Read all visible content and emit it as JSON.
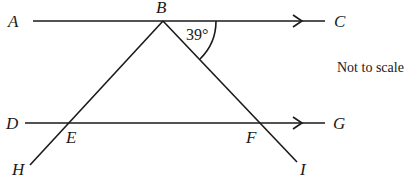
{
  "diagram": {
    "points": {
      "A": "A",
      "B": "B",
      "C": "C",
      "D": "D",
      "E": "E",
      "F": "F",
      "G": "G",
      "H": "H",
      "I": "I"
    },
    "angle_label": "39°",
    "note": "Not to scale",
    "lines": [
      {
        "name": "AC",
        "parallel_arrow": true
      },
      {
        "name": "DG",
        "parallel_arrow": true
      },
      {
        "name": "BH"
      },
      {
        "name": "BI"
      }
    ]
  }
}
